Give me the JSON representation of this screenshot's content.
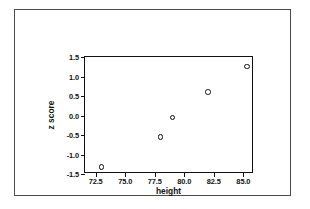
{
  "chart_data": {
    "type": "scatter",
    "title": "",
    "xlabel": "height",
    "ylabel": "z score",
    "xlim": [
      71.6,
      85.9
    ],
    "ylim": [
      -1.5,
      1.5
    ],
    "grid": false,
    "legend": "none",
    "marker": "open-circle",
    "xticks": [
      "72.5",
      "75.0",
      "77.5",
      "80.0",
      "82.5",
      "85.0"
    ],
    "xtick_values": [
      72.5,
      75.0,
      77.5,
      80.0,
      82.5,
      85.0
    ],
    "yticks": [
      "1.5",
      "1.0",
      "0.5",
      "0.0",
      "-0.5",
      "-1.0",
      "-1.5"
    ],
    "ytick_values": [
      1.5,
      1.0,
      0.5,
      0.0,
      -0.5,
      -1.0,
      -1.5
    ],
    "x": [
      73.0,
      78.0,
      79.0,
      82.0,
      85.3
    ],
    "y": [
      -1.32,
      -0.55,
      -0.05,
      0.6,
      1.25
    ],
    "points": [
      {
        "x": 73.0,
        "y": -1.32
      },
      {
        "x": 78.0,
        "y": -0.55
      },
      {
        "x": 79.0,
        "y": -0.05
      },
      {
        "x": 82.0,
        "y": 0.6
      },
      {
        "x": 85.3,
        "y": 1.25
      }
    ]
  },
  "colors": {
    "marker_stroke": "#0d0d0d",
    "marker_fill": "#ffffff",
    "axis": "#111111",
    "outer_frame": "#4a4a4a",
    "background": "#ffffff"
  }
}
